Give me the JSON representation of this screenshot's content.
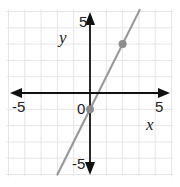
{
  "chart_data": {
    "type": "line",
    "title": "",
    "xlabel": "x",
    "ylabel": "y",
    "xlim": [
      -5,
      5
    ],
    "ylim": [
      -5,
      5
    ],
    "grid": true,
    "tick_labels": {
      "x_neg": "-5",
      "x_pos": "5",
      "y_pos": "5",
      "y_neg": "-5",
      "origin": "0"
    },
    "series": [
      {
        "name": "line",
        "equation": "y = 2x - 1",
        "slope": 2,
        "intercept": -1,
        "color": "#9a9a9a"
      }
    ],
    "points": [
      {
        "x": 0,
        "y": -1
      },
      {
        "x": 2,
        "y": 3
      }
    ],
    "colors": {
      "axis": "#111111",
      "grid": "#e6e6e6",
      "line": "#9a9a9a",
      "point": "#8c8c8c"
    }
  }
}
